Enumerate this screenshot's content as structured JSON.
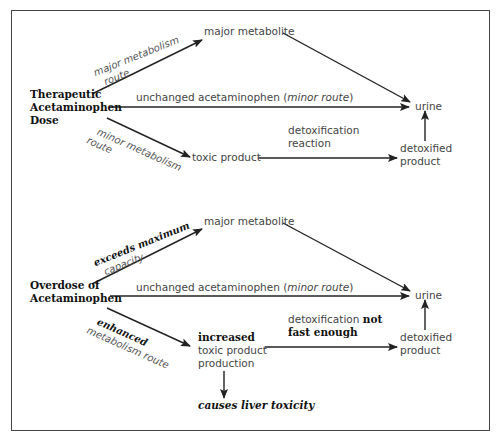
{
  "diagram": {
    "therapeutic": {
      "source_lines": [
        "Therapeutic",
        "Acetaminophen",
        "Dose"
      ],
      "major_metabolite": "major metabolite",
      "major_route_label": [
        "major metabolism",
        "route"
      ],
      "unchanged_text": "unchanged acetaminophen (",
      "unchanged_minor": "minor route",
      "unchanged_close": ")",
      "minor_route_label": [
        "minor metabolism",
        "route"
      ],
      "toxic_product": "toxic product",
      "detox_label": [
        "detoxification",
        "reaction"
      ],
      "detoxified_product": [
        "detoxified",
        "product"
      ],
      "urine": "urine"
    },
    "overdose": {
      "source_lines": [
        "Overdose of",
        "Acetaminophen"
      ],
      "major_metabolite": "major metabolite",
      "exceeds_label_bold": "exceeds maximum",
      "exceeds_label_rest": "capacity",
      "unchanged_text": "unchanged acetaminophen (",
      "unchanged_minor": "minor route",
      "unchanged_close": ")",
      "enhanced_label_bold": "enhanced",
      "enhanced_label_rest": "metabolism route",
      "toxic_lines_bold": "increased",
      "toxic_lines": [
        "toxic product",
        "production"
      ],
      "detox_label_plain": "detoxification ",
      "detox_label_bold1": "not",
      "detox_label_bold2": "fast enough",
      "detoxified_product": [
        "detoxified",
        "product"
      ],
      "urine": "urine",
      "outcome": "causes liver toxicity"
    },
    "colors": {
      "line": "#222222",
      "text": "#444444",
      "frame": "#444444"
    }
  }
}
